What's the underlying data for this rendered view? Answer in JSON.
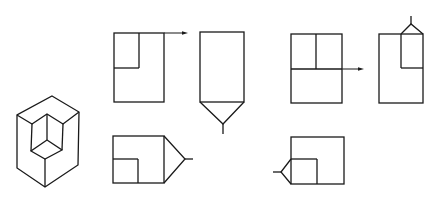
{
  "figure": {
    "colors": {
      "line": "#1a1a1a",
      "background": "#ffffff"
    },
    "isometric_view": {
      "outline": [
        [
          52,
          96
        ],
        [
          79,
          112
        ],
        [
          78,
          165
        ],
        [
          45,
          187
        ],
        [
          17,
          168
        ],
        [
          17,
          115
        ]
      ],
      "top_face_inner": [
        [
          17,
          115
        ],
        [
          32,
          124
        ],
        [
          47,
          114
        ],
        [
          63,
          124
        ],
        [
          79,
          112
        ]
      ],
      "notch_verticals": [
        [
          [
            32,
            124
          ],
          [
            31,
            151
          ]
        ],
        [
          [
            47,
            114
          ],
          [
            47,
            140
          ]
        ],
        [
          [
            63,
            124
          ],
          [
            62,
            150
          ]
        ]
      ],
      "notch_floor": [
        [
          47,
          140
        ],
        [
          31,
          151
        ],
        [
          45,
          159
        ],
        [
          62,
          150
        ],
        [
          47,
          140
        ]
      ],
      "front_edge": [
        [
          45,
          159
        ],
        [
          45,
          187
        ]
      ]
    },
    "views": [
      {
        "id": "view-1",
        "rect": [
          114,
          33,
          164,
          102
        ],
        "inner_lines": [
          [
            [
              139,
              33
            ],
            [
              139,
              68
            ]
          ],
          [
            [
              114,
              68
            ],
            [
              139,
              68
            ]
          ]
        ],
        "arrow": {
          "from": [
            164,
            33
          ],
          "to": [
            188,
            33
          ]
        }
      },
      {
        "id": "view-2",
        "rect": [
          200,
          32,
          244,
          102
        ],
        "symbol": {
          "type": "v-bottom",
          "points": [
            [
              200,
              102
            ],
            [
              223,
              124
            ],
            [
              244,
              102
            ]
          ],
          "stem": [
            [
              223,
              124
            ],
            [
              223,
              134
            ]
          ]
        }
      },
      {
        "id": "view-3",
        "rect": [
          291,
          34,
          342,
          103
        ],
        "inner_lines": [
          [
            [
              316,
              34
            ],
            [
              316,
              69
            ]
          ],
          [
            [
              291,
              69
            ],
            [
              342,
              69
            ]
          ]
        ],
        "arrow": {
          "from": [
            342,
            69
          ],
          "to": [
            364,
            69
          ]
        }
      },
      {
        "id": "view-4",
        "rect": [
          379,
          34,
          423,
          103
        ],
        "inner_lines": [
          [
            [
              401,
              34
            ],
            [
              401,
              68
            ]
          ],
          [
            [
              401,
              68
            ],
            [
              423,
              68
            ]
          ]
        ],
        "symbol": {
          "type": "v-top",
          "points": [
            [
              401,
              34
            ],
            [
              411,
              24
            ],
            [
              423,
              34
            ]
          ],
          "stem": [
            [
              411,
              24
            ],
            [
              411,
              16
            ]
          ]
        }
      },
      {
        "id": "view-5",
        "rect": [
          113,
          136,
          164,
          183
        ],
        "inner_lines": [
          [
            [
              113,
              159
            ],
            [
              138,
              159
            ]
          ],
          [
            [
              138,
              159
            ],
            [
              138,
              183
            ]
          ]
        ],
        "symbol": {
          "type": "v-right",
          "points": [
            [
              164,
              136
            ],
            [
              185,
              159
            ],
            [
              164,
              183
            ]
          ],
          "stem": [
            [
              185,
              159
            ],
            [
              193,
              159
            ]
          ]
        }
      },
      {
        "id": "view-6",
        "rect": [
          291,
          137,
          344,
          184
        ],
        "inner_lines": [
          [
            [
              291,
              159
            ],
            [
              317,
              159
            ]
          ],
          [
            [
              317,
              159
            ],
            [
              317,
              184
            ]
          ]
        ],
        "symbol": {
          "type": "v-left",
          "points": [
            [
              291,
              159
            ],
            [
              281,
              172
            ],
            [
              291,
              184
            ]
          ],
          "stem": [
            [
              281,
              172
            ],
            [
              273,
              172
            ]
          ]
        }
      }
    ]
  }
}
